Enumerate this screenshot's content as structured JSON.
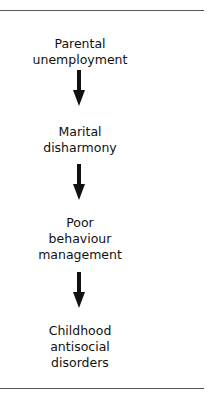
{
  "diagram": {
    "type": "vertical-flowchart",
    "nodes": [
      {
        "label_line1": "Parental",
        "label_line2": "unemployment"
      },
      {
        "label_line1": "Marital",
        "label_line2": "disharmony"
      },
      {
        "label_line1": "Poor",
        "label_line2": "behaviour",
        "label_line3": "management"
      },
      {
        "label_line1": "Childhood",
        "label_line2": "antisocial",
        "label_line3": "disorders"
      }
    ],
    "edges": [
      {
        "from": "Parental unemployment",
        "to": "Marital disharmony"
      },
      {
        "from": "Marital disharmony",
        "to": "Poor behaviour management"
      },
      {
        "from": "Poor behaviour management",
        "to": "Childhood antisocial disorders"
      }
    ]
  }
}
